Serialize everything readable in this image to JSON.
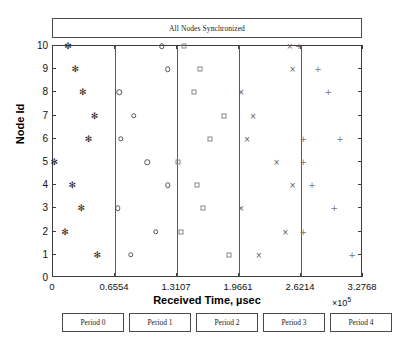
{
  "chart_data": {
    "type": "scatter",
    "title": "All Nodes Synchronized",
    "xlabel": "Received Time, µsec",
    "ylabel": "Node Id",
    "x_exponent": "×10",
    "x_exponent_power": "5",
    "xlim": [
      0,
      3.2768
    ],
    "ylim": [
      0,
      10
    ],
    "xticks": [
      0,
      0.6554,
      1.3107,
      1.9661,
      2.6214,
      3.2768
    ],
    "xtick_labels": [
      "0",
      "0.6554",
      "1.3107",
      "1.9661",
      "2.6214",
      "3.2768"
    ],
    "yticks": [
      0,
      1,
      2,
      3,
      4,
      5,
      6,
      7,
      8,
      9,
      10
    ],
    "ytick_labels": [
      "0",
      "1",
      "2",
      "3",
      "4",
      "5",
      "6",
      "7",
      "8",
      "9",
      "10"
    ],
    "grid": false,
    "legend_position": "below-axis",
    "period_boundaries": [
      0.6554,
      1.3107,
      1.9661,
      2.6214
    ],
    "series": [
      {
        "name": "Period 0",
        "marker": "asterisk",
        "color": "#222222",
        "points": [
          {
            "x": 0.155,
            "y": 10
          },
          {
            "x": 0.233,
            "y": 9
          },
          {
            "x": 0.311,
            "y": 8
          },
          {
            "x": 0.435,
            "y": 7
          },
          {
            "x": 0.373,
            "y": 6
          },
          {
            "x": 0.01,
            "y": 5
          },
          {
            "x": 0.202,
            "y": 4
          },
          {
            "x": 0.295,
            "y": 3
          },
          {
            "x": 0.124,
            "y": 2
          },
          {
            "x": 0.466,
            "y": 1
          }
        ]
      },
      {
        "name": "Period 1",
        "marker": "circle",
        "color": "#555555",
        "points": [
          {
            "x": 1.15,
            "y": 10
          },
          {
            "x": 1.212,
            "y": 9
          },
          {
            "x": 0.7,
            "y": 8
          },
          {
            "x": 0.855,
            "y": 7
          },
          {
            "x": 0.715,
            "y": 6
          },
          {
            "x": 0.995,
            "y": 5
          },
          {
            "x": 1.212,
            "y": 4
          },
          {
            "x": 0.684,
            "y": 3
          },
          {
            "x": 1.088,
            "y": 2
          },
          {
            "x": 0.824,
            "y": 1
          }
        ]
      },
      {
        "name": "Period 2",
        "marker": "square",
        "color": "#888888",
        "points": [
          {
            "x": 1.383,
            "y": 10
          },
          {
            "x": 1.554,
            "y": 9
          },
          {
            "x": 1.492,
            "y": 8
          },
          {
            "x": 1.803,
            "y": 7
          },
          {
            "x": 1.663,
            "y": 6
          },
          {
            "x": 1.321,
            "y": 5
          },
          {
            "x": 1.523,
            "y": 4
          },
          {
            "x": 1.585,
            "y": 3
          },
          {
            "x": 1.352,
            "y": 2
          },
          {
            "x": 1.865,
            "y": 1
          }
        ]
      },
      {
        "name": "Period 3",
        "marker": "cross",
        "color": "#555555",
        "points": [
          {
            "x": 2.503,
            "y": 10
          },
          {
            "x": 2.534,
            "y": 9
          },
          {
            "x": 1.989,
            "y": 8
          },
          {
            "x": 2.114,
            "y": 7
          },
          {
            "x": 2.051,
            "y": 6
          },
          {
            "x": 2.363,
            "y": 5
          },
          {
            "x": 2.534,
            "y": 4
          },
          {
            "x": 1.989,
            "y": 3
          },
          {
            "x": 2.456,
            "y": 2
          },
          {
            "x": 2.176,
            "y": 1
          }
        ]
      },
      {
        "name": "Period 4",
        "marker": "plus",
        "color": "#777777",
        "points": [
          {
            "x": 2.596,
            "y": 10
          },
          {
            "x": 2.798,
            "y": 9
          },
          {
            "x": 2.907,
            "y": 8
          },
          {
            "x": 3.032,
            "y": 6
          },
          {
            "x": 2.643,
            "y": 6
          },
          {
            "x": 2.643,
            "y": 5
          },
          {
            "x": 2.736,
            "y": 4
          },
          {
            "x": 2.969,
            "y": 3
          },
          {
            "x": 2.643,
            "y": 2
          },
          {
            "x": 3.157,
            "y": 1
          }
        ]
      }
    ]
  },
  "legend": {
    "items": [
      {
        "label": "Period 0"
      },
      {
        "label": "Period 1"
      },
      {
        "label": "Period 2"
      },
      {
        "label": "Period 3"
      },
      {
        "label": "Period 4"
      }
    ]
  }
}
